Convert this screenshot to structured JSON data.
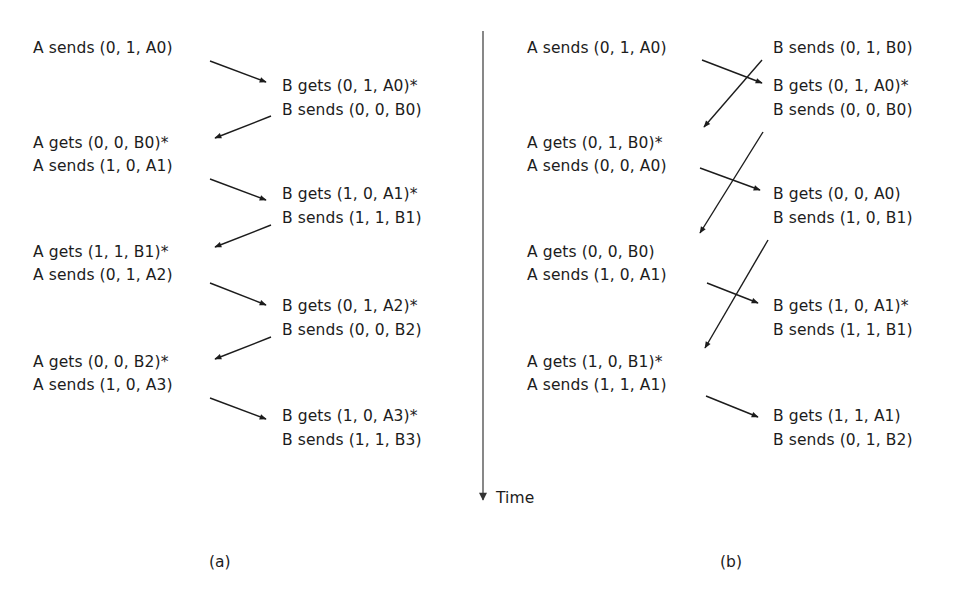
{
  "figure": {
    "time_label": "Time",
    "panels": [
      {
        "caption": "(a)",
        "events": [
          {
            "text": "A sends (0, 1, A0)",
            "x": 33,
            "y": 39
          },
          {
            "text": "B gets (0, 1, A0)*",
            "x": 282,
            "y": 77
          },
          {
            "text": "B sends (0, 0, B0)",
            "x": 282,
            "y": 101
          },
          {
            "text": "A gets (0, 0, B0)*",
            "x": 33,
            "y": 134
          },
          {
            "text": "A sends (1, 0, A1)",
            "x": 33,
            "y": 157
          },
          {
            "text": "B gets (1, 0, A1)*",
            "x": 282,
            "y": 185
          },
          {
            "text": "B sends (1, 1, B1)",
            "x": 282,
            "y": 209
          },
          {
            "text": "A gets (1, 1, B1)*",
            "x": 33,
            "y": 243
          },
          {
            "text": "A sends (0, 1, A2)",
            "x": 33,
            "y": 266
          },
          {
            "text": "B gets (0, 1, A2)*",
            "x": 282,
            "y": 297
          },
          {
            "text": "B sends (0, 0, B2)",
            "x": 282,
            "y": 321
          },
          {
            "text": "A gets (0, 0, B2)*",
            "x": 33,
            "y": 353
          },
          {
            "text": "A sends (1, 0, A3)",
            "x": 33,
            "y": 376
          },
          {
            "text": "B gets (1, 0, A3)*",
            "x": 282,
            "y": 407
          },
          {
            "text": "B sends (1, 1, B3)",
            "x": 282,
            "y": 431
          }
        ],
        "arrows": [
          {
            "from": [
              210,
              61
            ],
            "to": [
              266,
              82
            ]
          },
          {
            "from": [
              271,
              116
            ],
            "to": [
              215,
              138
            ]
          },
          {
            "from": [
              210,
              179
            ],
            "to": [
              266,
              200
            ]
          },
          {
            "from": [
              271,
              225
            ],
            "to": [
              215,
              247
            ]
          },
          {
            "from": [
              210,
              283
            ],
            "to": [
              266,
              305
            ]
          },
          {
            "from": [
              271,
              337
            ],
            "to": [
              215,
              359
            ]
          },
          {
            "from": [
              210,
              398
            ],
            "to": [
              266,
              419
            ]
          }
        ]
      },
      {
        "caption": "(b)",
        "events": [
          {
            "text": "A sends (0, 1, A0)",
            "x": 527,
            "y": 39
          },
          {
            "text": "B sends (0, 1, B0)",
            "x": 773,
            "y": 39
          },
          {
            "text": "B gets (0, 1, A0)*",
            "x": 773,
            "y": 77
          },
          {
            "text": "B sends (0, 0, B0)",
            "x": 773,
            "y": 101
          },
          {
            "text": "A gets (0, 1, B0)*",
            "x": 527,
            "y": 134
          },
          {
            "text": "A sends (0, 0, A0)",
            "x": 527,
            "y": 157
          },
          {
            "text": "B gets (0, 0, A0)",
            "x": 773,
            "y": 185
          },
          {
            "text": "B sends (1, 0, B1)",
            "x": 773,
            "y": 209
          },
          {
            "text": "A gets (0, 0, B0)",
            "x": 527,
            "y": 243
          },
          {
            "text": "A sends (1, 0, A1)",
            "x": 527,
            "y": 266
          },
          {
            "text": "B gets (1, 0, A1)*",
            "x": 773,
            "y": 297
          },
          {
            "text": "B sends (1, 1, B1)",
            "x": 773,
            "y": 321
          },
          {
            "text": "A gets (1, 0, B1)*",
            "x": 527,
            "y": 353
          },
          {
            "text": "A sends (1, 1, A1)",
            "x": 527,
            "y": 376
          },
          {
            "text": "B gets (1, 1, A1)",
            "x": 773,
            "y": 407
          },
          {
            "text": "B sends (0, 1, B2)",
            "x": 773,
            "y": 431
          }
        ],
        "arrows": [
          {
            "from": [
              702,
              60
            ],
            "to": [
              762,
              83
            ]
          },
          {
            "from": [
              762,
              60
            ],
            "to": [
              704,
              127
            ]
          },
          {
            "from": [
              700,
              168
            ],
            "to": [
              760,
              190
            ]
          },
          {
            "from": [
              763,
              132
            ],
            "to": [
              700,
              233
            ]
          },
          {
            "from": [
              707,
              283
            ],
            "to": [
              758,
              303
            ]
          },
          {
            "from": [
              768,
              240
            ],
            "to": [
              705,
              348
            ]
          },
          {
            "from": [
              706,
              396
            ],
            "to": [
              758,
              417
            ]
          }
        ]
      }
    ],
    "colors": {
      "ink": "#1c1c1c",
      "axis": "#555555",
      "background": "#ffffff"
    }
  }
}
